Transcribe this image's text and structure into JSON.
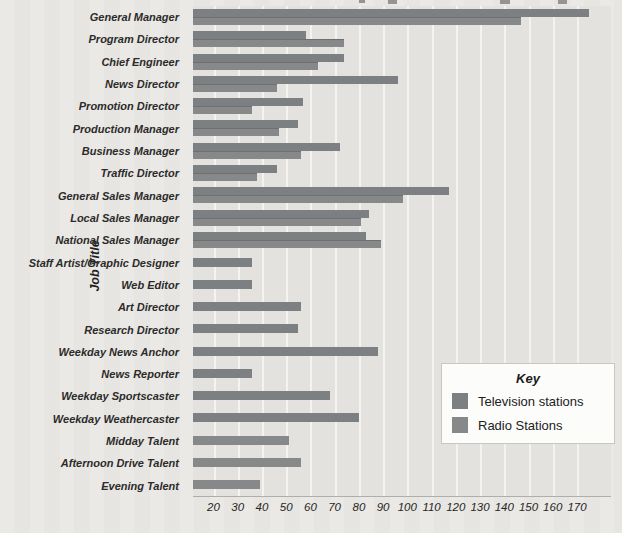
{
  "page": {
    "background": "#eae8e4",
    "plot_background": "#e4e2de",
    "gridline_color": "#f4f3f0",
    "axis_line_color": "#b0aeaa"
  },
  "y_axis_title": "Job Title",
  "legend": {
    "title": "Key",
    "items": [
      {
        "label": "Television stations",
        "color": "#7d8082"
      },
      {
        "label": "Radio Stations",
        "color": "#868889"
      }
    ]
  },
  "chart_data": {
    "type": "bar",
    "orientation": "horizontal",
    "title": "",
    "xlabel": "",
    "ylabel": "Job Title",
    "grid": true,
    "legend_position": "lower-right",
    "legend_title": "Key",
    "x_ticks": [
      20,
      30,
      40,
      50,
      60,
      70,
      80,
      90,
      100,
      110,
      120,
      130,
      140,
      150,
      160,
      170
    ],
    "xlim": [
      11.5,
      176
    ],
    "categories": [
      "General Manager",
      "Program Director",
      "Chief Engineer",
      "News Director",
      "Promotion Director",
      "Production Manager",
      "Business Manager",
      "Traffic Director",
      "General Sales Manager",
      "Local Sales Manager",
      "National Sales Manager",
      "Staff Artist/Graphic Designer",
      "Web Editor",
      "Art Director",
      "Research Director",
      "Weekday News Anchor",
      "News Reporter",
      "Weekday Sportscaster",
      "Weekday Weathercaster",
      "Midday Talent",
      "Afternoon Drive Talent",
      "Evening Talent"
    ],
    "series": [
      {
        "name": "Television stations",
        "color": "#7d8082",
        "values": [
          175,
          58,
          74,
          96,
          57,
          55,
          72,
          46,
          117,
          84,
          83,
          36,
          36,
          56,
          55,
          88,
          36,
          68,
          80,
          null,
          null,
          null
        ]
      },
      {
        "name": "Radio Stations",
        "color": "#868889",
        "values": [
          147,
          74,
          63,
          46,
          36,
          47,
          56,
          38,
          98,
          81,
          89,
          null,
          null,
          null,
          null,
          null,
          null,
          null,
          null,
          51,
          56,
          39
        ]
      }
    ]
  }
}
